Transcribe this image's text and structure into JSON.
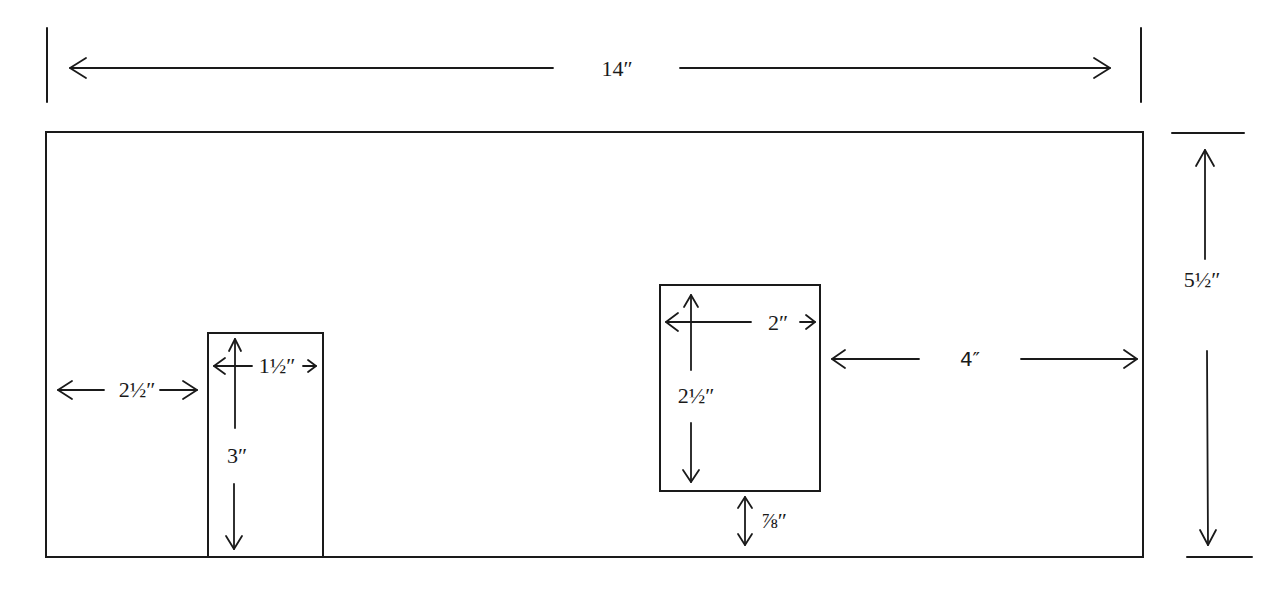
{
  "diagram": {
    "type": "dimensioned-panel-drawing",
    "units": "inches",
    "panel": {
      "width_label": "14″",
      "height_label": "5½″"
    },
    "left_opening": {
      "offset_from_left_label": "2½″",
      "width_label": "1½″",
      "height_label": "3″"
    },
    "right_opening": {
      "width_label": "2″",
      "height_label": "2½″",
      "offset_from_bottom_label": "⅞″",
      "offset_from_right_label": "4″"
    },
    "colors": {
      "ink": "#1a1a1a",
      "background": "#ffffff"
    }
  }
}
